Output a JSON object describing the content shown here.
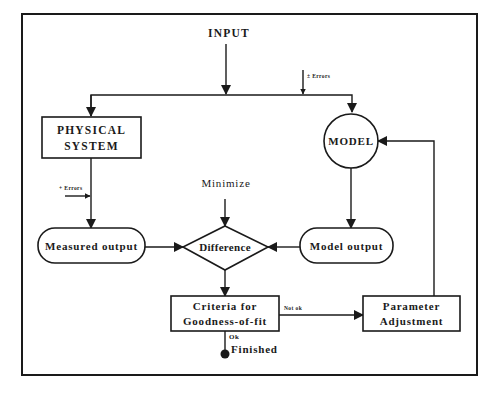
{
  "diagram": {
    "type": "flowchart",
    "nodes": {
      "input": {
        "label": "INPUT"
      },
      "physical_system": {
        "line1": "PHYSICAL",
        "line2": "SYSTEM"
      },
      "model": {
        "label": "MODEL"
      },
      "minimize": {
        "label": "Minimize"
      },
      "measured_output": {
        "label": "Measured output"
      },
      "difference": {
        "label": "Difference"
      },
      "model_output": {
        "label": "Model output"
      },
      "criteria": {
        "line1": "Criteria for",
        "line2": "Goodness-of-fit"
      },
      "parameter_adjustment": {
        "line1": "Parameter",
        "line2": "Adjustment"
      },
      "finished": {
        "label": "Finished"
      }
    },
    "annotations": {
      "errors_model": "± Errors",
      "errors_measured": "+ Errors",
      "not_ok": "Not ok",
      "ok": "Ok"
    },
    "edges": [
      {
        "from": "INPUT",
        "to": "PHYSICAL SYSTEM"
      },
      {
        "from": "INPUT",
        "to": "MODEL"
      },
      {
        "from": "PHYSICAL SYSTEM",
        "to": "Measured output"
      },
      {
        "from": "MODEL",
        "to": "Model output"
      },
      {
        "from": "Measured output",
        "to": "Difference"
      },
      {
        "from": "Model output",
        "to": "Difference"
      },
      {
        "from": "Minimize",
        "to": "Difference"
      },
      {
        "from": "Difference",
        "to": "Criteria for Goodness-of-fit"
      },
      {
        "from": "Criteria for Goodness-of-fit",
        "to": "Parameter Adjustment",
        "label": "Not ok"
      },
      {
        "from": "Criteria for Goodness-of-fit",
        "to": "Finished",
        "label": "Ok"
      },
      {
        "from": "Parameter Adjustment",
        "to": "MODEL"
      }
    ],
    "colors": {
      "ink": "#1a1a1a",
      "background": "#ffffff"
    }
  }
}
